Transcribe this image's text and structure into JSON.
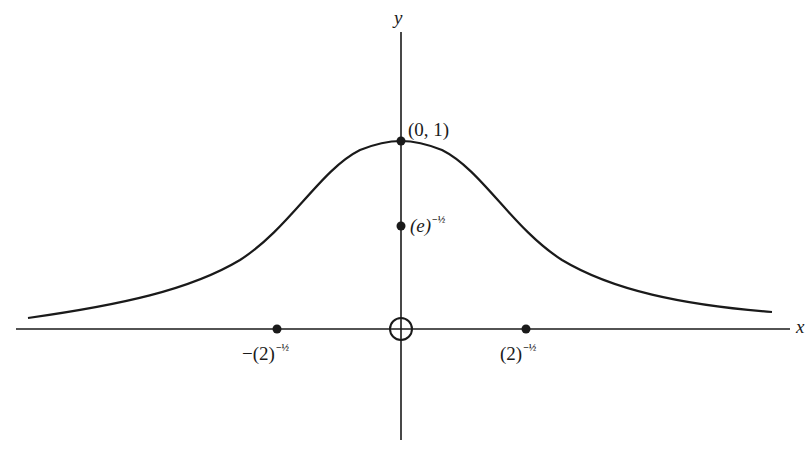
{
  "axes": {
    "x_label": "x",
    "y_label": "y"
  },
  "points": {
    "peak": {
      "label": "(0, 1)"
    },
    "e_point": {
      "base": "(e)",
      "exp": "−½"
    },
    "left_inflection": {
      "base": "−(2)",
      "exp": "−½"
    },
    "right_inflection": {
      "base": "(2)",
      "exp": "−½"
    }
  },
  "colors": {
    "ink": "#1a1a1a",
    "background": "#ffffff"
  }
}
